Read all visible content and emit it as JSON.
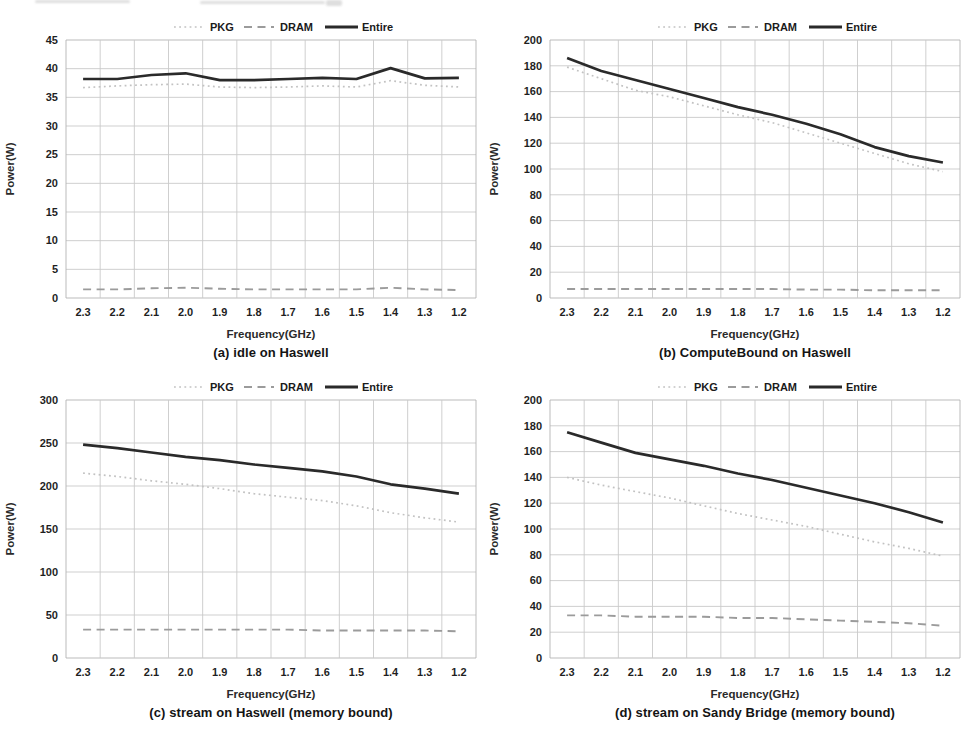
{
  "page": {
    "background": "#ffffff",
    "description_labels": {
      "pkg": "PKG",
      "dram": "DRAM",
      "entire": "Entire"
    }
  },
  "style": {
    "grid_color": "#c9c9c9",
    "border_color": "#b3b3b3",
    "axis_color": "#9e9e9e",
    "tick_text_color": "#1f1f1f",
    "axis_title_color": "#2a2a2a",
    "legend_text_color": "#1b1b1b"
  },
  "chart_data": [
    {
      "id": "a",
      "type": "line",
      "title": "(a) idle on Haswell",
      "xlabel": "Frequency(GHz)",
      "ylabel": "Power(W)",
      "categories": [
        "2.3",
        "2.2",
        "2.1",
        "2.0",
        "1.9",
        "1.8",
        "1.7",
        "1.6",
        "1.5",
        "1.4",
        "1.3",
        "1.2"
      ],
      "ylim": [
        0,
        45
      ],
      "ytick_step": 5,
      "grid": true,
      "legend_position": "top",
      "series": [
        {
          "name": "PKG",
          "style": "dotted",
          "color": "#c2c2c2",
          "values": [
            36.7,
            37.0,
            37.2,
            37.3,
            36.8,
            36.7,
            36.8,
            37.0,
            36.8,
            37.9,
            37.1,
            36.8
          ]
        },
        {
          "name": "DRAM",
          "style": "dashed",
          "color": "#9b9b9b",
          "values": [
            1.5,
            1.5,
            1.7,
            1.8,
            1.6,
            1.5,
            1.5,
            1.5,
            1.5,
            1.8,
            1.5,
            1.4
          ]
        },
        {
          "name": "Entire",
          "style": "solid",
          "color": "#2a2a2a",
          "values": [
            38.2,
            38.2,
            38.9,
            39.2,
            38.0,
            38.0,
            38.2,
            38.4,
            38.2,
            40.1,
            38.3,
            38.4
          ]
        }
      ]
    },
    {
      "id": "b",
      "type": "line",
      "title": "(b) ComputeBound on Haswell",
      "xlabel": "Frequency(GHz)",
      "ylabel": "Power(W)",
      "categories": [
        "2.3",
        "2.2",
        "2.1",
        "2.0",
        "1.9",
        "1.8",
        "1.7",
        "1.6",
        "1.5",
        "1.4",
        "1.3",
        "1.2"
      ],
      "ylim": [
        0,
        200
      ],
      "ytick_step": 20,
      "grid": true,
      "legend_position": "top",
      "series": [
        {
          "name": "PKG",
          "style": "dotted",
          "color": "#c2c2c2",
          "values": [
            179,
            170,
            161,
            156,
            149,
            142,
            136,
            128,
            120,
            112,
            104,
            98
          ]
        },
        {
          "name": "DRAM",
          "style": "dashed",
          "color": "#9b9b9b",
          "values": [
            7,
            7,
            7,
            7,
            7,
            7,
            7,
            6.5,
            6.5,
            6,
            6,
            6
          ]
        },
        {
          "name": "Entire",
          "style": "solid",
          "color": "#2a2a2a",
          "values": [
            186,
            176,
            169,
            162,
            155,
            148,
            142,
            135,
            127,
            117,
            110,
            105
          ]
        }
      ]
    },
    {
      "id": "c",
      "type": "line",
      "title": "(c) stream on Haswell (memory bound)",
      "xlabel": "Frequency(GHz)",
      "ylabel": "Power(W)",
      "categories": [
        "2.3",
        "2.2",
        "2.1",
        "2.0",
        "1.9",
        "1.8",
        "1.7",
        "1.6",
        "1.5",
        "1.4",
        "1.3",
        "1.2"
      ],
      "ylim": [
        0,
        300
      ],
      "ytick_step": 50,
      "grid": true,
      "legend_position": "top",
      "series": [
        {
          "name": "PKG",
          "style": "dotted",
          "color": "#c2c2c2",
          "values": [
            215,
            211,
            206,
            202,
            197,
            191,
            187,
            183,
            177,
            169,
            163,
            158
          ]
        },
        {
          "name": "DRAM",
          "style": "dashed",
          "color": "#9b9b9b",
          "values": [
            33,
            33,
            33,
            33,
            33,
            33,
            33,
            32,
            32,
            32,
            32,
            31
          ]
        },
        {
          "name": "Entire",
          "style": "solid",
          "color": "#2a2a2a",
          "values": [
            248,
            244,
            239,
            234,
            230,
            225,
            221,
            217,
            211,
            202,
            197,
            191
          ]
        }
      ]
    },
    {
      "id": "d",
      "type": "line",
      "title": "(d) stream on Sandy Bridge (memory bound)",
      "xlabel": "Frequency(GHz)",
      "ylabel": "Power(W)",
      "categories": [
        "2.3",
        "2.2",
        "2.1",
        "2.0",
        "1.9",
        "1.8",
        "1.7",
        "1.6",
        "1.5",
        "1.4",
        "1.3",
        "1.2"
      ],
      "ylim": [
        0,
        200
      ],
      "ytick_step": 20,
      "grid": true,
      "legend_position": "top",
      "series": [
        {
          "name": "PKG",
          "style": "dotted",
          "color": "#c2c2c2",
          "values": [
            140,
            134,
            129,
            124,
            118,
            112,
            107,
            102,
            96,
            90,
            85,
            79
          ]
        },
        {
          "name": "DRAM",
          "style": "dashed",
          "color": "#9b9b9b",
          "values": [
            33,
            33,
            32,
            32,
            32,
            31,
            31,
            30,
            29,
            28,
            27,
            25
          ]
        },
        {
          "name": "Entire",
          "style": "solid",
          "color": "#2a2a2a",
          "values": [
            175,
            167,
            159,
            154,
            149,
            143,
            138,
            132,
            126,
            120,
            113,
            105
          ]
        }
      ]
    }
  ]
}
